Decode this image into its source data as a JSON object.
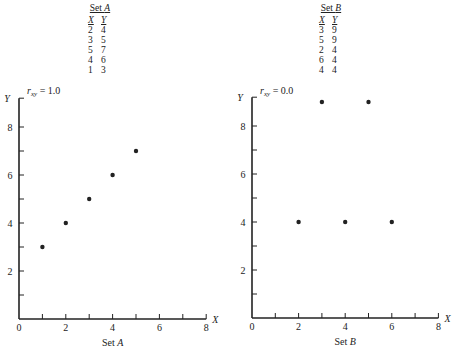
{
  "tables": [
    {
      "title_prefix": "Set ",
      "title_var": "A",
      "headers": [
        "X",
        "Y"
      ],
      "rows": [
        [
          2,
          4
        ],
        [
          3,
          5
        ],
        [
          5,
          7
        ],
        [
          4,
          6
        ],
        [
          1,
          3
        ]
      ]
    },
    {
      "title_prefix": "Set ",
      "title_var": "B",
      "headers": [
        "X",
        "Y"
      ],
      "rows": [
        [
          3,
          9
        ],
        [
          5,
          9
        ],
        [
          2,
          4
        ],
        [
          6,
          4
        ],
        [
          4,
          4
        ]
      ]
    }
  ],
  "chart_data": [
    {
      "type": "scatter",
      "title": "r_xy = 1.0",
      "annotation": "r_xy = 1.0",
      "xlabel": "X",
      "ylabel": "Y",
      "caption": "Set A",
      "xlim": [
        0,
        8
      ],
      "ylim": [
        0,
        9
      ],
      "xticks": [
        0,
        2,
        4,
        6,
        8
      ],
      "yticks": [
        2,
        4,
        6,
        8
      ],
      "grid": false,
      "x": [
        2,
        3,
        5,
        4,
        1
      ],
      "y": [
        4,
        5,
        7,
        6,
        3
      ]
    },
    {
      "type": "scatter",
      "title": "r_xy = 0.0",
      "annotation": "r_xy = 0.0",
      "xlabel": "X",
      "ylabel": "Y",
      "caption": "Set B",
      "xlim": [
        0,
        8
      ],
      "ylim": [
        0,
        9
      ],
      "xticks": [
        0,
        2,
        4,
        6,
        8
      ],
      "yticks": [
        2,
        4,
        6,
        8
      ],
      "grid": false,
      "x": [
        3,
        5,
        2,
        6,
        4
      ],
      "y": [
        9,
        9,
        4,
        4,
        4
      ]
    }
  ],
  "labels": {
    "r_symbol": "r",
    "r_sub": "xy",
    "r_a_value": " = 1.0",
    "r_b_value": " = 0.0",
    "caption_prefix": "Set ",
    "caption_a": "A",
    "caption_b": "B",
    "axis_x": "X",
    "axis_y": "Y"
  },
  "colors": {
    "ink": "#222222",
    "background": "#ffffff"
  }
}
